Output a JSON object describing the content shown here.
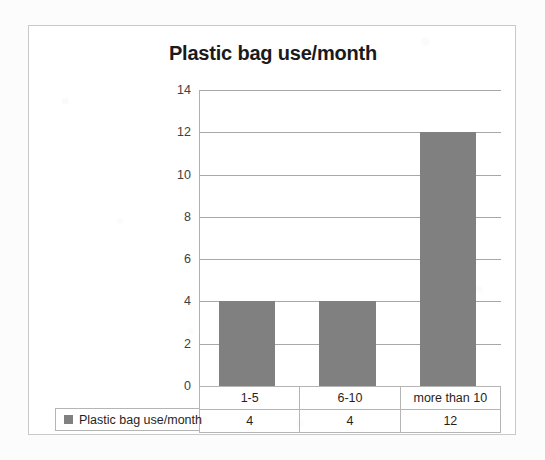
{
  "chart_data": {
    "type": "bar",
    "title": "Plastic bag use/month",
    "xlabel": "",
    "ylabel": "",
    "categories": [
      "1-5",
      "6-10",
      "more than 10"
    ],
    "values": [
      4,
      4,
      12
    ],
    "series": [
      {
        "name": "Plastic bag use/month",
        "values": [
          4,
          4,
          12
        ]
      }
    ],
    "ylim": [
      0,
      14
    ],
    "ytick_labels": [
      "0",
      "2",
      "4",
      "6",
      "8",
      "10",
      "12",
      "14"
    ],
    "ytick_values": [
      0,
      2,
      4,
      6,
      8,
      10,
      12,
      14
    ],
    "grid": true,
    "legend_position": "data-table-left",
    "bar_color": "#808080",
    "gridline_color": "#a8a8a8",
    "frame_border_color": "#c9c9c9",
    "plot_background": "#ffffff"
  },
  "legend": {
    "series_label": "Plastic bag use/month",
    "swatch_color": "#808080"
  },
  "data_table": {
    "category_row": [
      "1-5",
      "6-10",
      "more than 10"
    ],
    "value_row": [
      "4",
      "4",
      "12"
    ]
  }
}
